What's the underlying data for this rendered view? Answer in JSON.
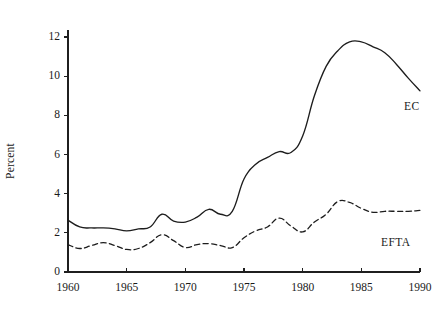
{
  "figure": {
    "background": "#ffffff",
    "ink_color": "#1d1d1d"
  },
  "axes": {
    "ylabel": "Percent",
    "xlabel": "",
    "y_ticks": [
      "0",
      "2",
      "4",
      "6",
      "8",
      "10",
      "12"
    ],
    "x_ticks": [
      "1960",
      "1965",
      "1970",
      "1975",
      "1980",
      "1985",
      "1990"
    ]
  },
  "annotations": {
    "ec_label": "EC",
    "efta_label": "EFTA"
  },
  "chart_data": {
    "type": "line",
    "title": "",
    "xlabel": "",
    "ylabel": "Percent",
    "xlim": [
      1960,
      1990
    ],
    "ylim": [
      0,
      12.6
    ],
    "grid": false,
    "legend": "inline-labels",
    "x": [
      1960,
      1961,
      1962,
      1963,
      1964,
      1965,
      1966,
      1967,
      1968,
      1969,
      1970,
      1971,
      1972,
      1973,
      1974,
      1975,
      1976,
      1977,
      1978,
      1979,
      1980,
      1981,
      1982,
      1983,
      1984,
      1985,
      1986,
      1987,
      1988,
      1989,
      1990
    ],
    "series": [
      {
        "name": "EC",
        "style": "solid",
        "color": "#1d1d1d",
        "values": [
          2.65,
          2.3,
          2.25,
          2.25,
          2.2,
          2.1,
          2.2,
          2.3,
          2.95,
          2.6,
          2.55,
          2.8,
          3.2,
          2.95,
          3.1,
          4.75,
          5.5,
          5.85,
          6.15,
          6.1,
          6.95,
          9.0,
          10.5,
          11.3,
          11.75,
          11.75,
          11.5,
          11.2,
          10.6,
          9.9,
          9.25
        ]
      },
      {
        "name": "EFTA",
        "style": "dashed",
        "color": "#1d1d1d",
        "values": [
          1.4,
          1.2,
          1.35,
          1.5,
          1.35,
          1.15,
          1.2,
          1.5,
          1.9,
          1.6,
          1.25,
          1.4,
          1.45,
          1.35,
          1.25,
          1.75,
          2.1,
          2.3,
          2.75,
          2.35,
          2.05,
          2.55,
          2.95,
          3.6,
          3.55,
          3.25,
          3.05,
          3.1,
          3.1,
          3.1,
          3.15
        ]
      }
    ]
  }
}
